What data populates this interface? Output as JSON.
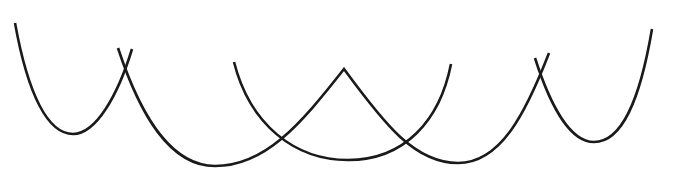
{
  "diagram": {
    "width": 677,
    "height": 176,
    "background": "#ffffff",
    "stroke_color": "#1a1a1a",
    "stroke_width": 2.6,
    "curves": [
      {
        "name": "left-u-curve",
        "description": "Small U-shaped arc on the far left",
        "path": "M 15 23 C 28 95, 48 134, 73 134 C 96 134, 118 95, 132 49"
      },
      {
        "name": "long-wave-curve",
        "description": "Long curve: wide valley, sharp peak, second wide valley",
        "path": "M 118 48 C 140 115, 170 166, 215 166 C 265 166, 300 125, 344 69 C 385 125, 415 163, 458 163 C 500 163, 525 115, 549 53"
      },
      {
        "name": "middle-u-curve",
        "description": "Wide U-shaped arc in the center",
        "path": "M 234 62 C 250 125, 295 160, 348 160 C 405 160, 440 120, 451 64"
      },
      {
        "name": "right-u-curve",
        "description": "U-shaped arc on the far right rising higher on the right side",
        "path": "M 535 58 C 550 105, 570 142, 594 142 C 622 142, 640 100, 652 29"
      }
    ],
    "intersections": [
      {
        "x": 125,
        "y": 70
      },
      {
        "x": 279,
        "y": 139
      },
      {
        "x": 405,
        "y": 142
      },
      {
        "x": 541,
        "y": 77
      }
    ]
  }
}
